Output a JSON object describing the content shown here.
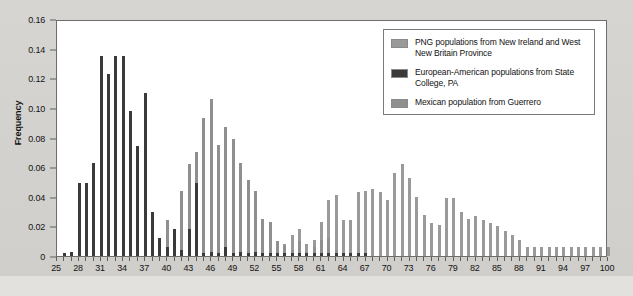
{
  "chart_data": {
    "type": "bar",
    "title": "",
    "xlabel": "",
    "ylabel": "Frequency",
    "xlim": [
      25,
      100
    ],
    "ylim": [
      0,
      0.16
    ],
    "ytick_labels": [
      "0",
      "0.02",
      "0.04",
      "0.06",
      "0.08",
      "0.10",
      "0.12",
      "0.14",
      "0.16"
    ],
    "ytick_values": [
      0,
      0.02,
      0.04,
      0.06,
      0.08,
      0.1,
      0.12,
      0.14,
      0.16
    ],
    "xtick_labels": [
      "25",
      "28",
      "31",
      "34",
      "37",
      "40",
      "43",
      "46",
      "49",
      "52",
      "55",
      "58",
      "61",
      "64",
      "67",
      "70",
      "73",
      "76",
      "79",
      "82",
      "85",
      "88",
      "91",
      "94",
      "97",
      "100"
    ],
    "xtick_values": [
      25,
      28,
      31,
      34,
      37,
      40,
      43,
      46,
      49,
      52,
      55,
      58,
      61,
      64,
      67,
      70,
      73,
      76,
      79,
      82,
      85,
      88,
      91,
      94,
      97,
      100
    ],
    "grid": false,
    "legend_position": "top-right",
    "colors": {
      "png": "#9a9a9a",
      "european_american": "#3a3a3a",
      "mexican": "#8f8f8f"
    },
    "series": [
      {
        "name": "European-American populations from State College, PA",
        "color": "#3a3a3a",
        "x": [
          26,
          27,
          28,
          29,
          30,
          31,
          32,
          33,
          34,
          35,
          36,
          37,
          38,
          39,
          40,
          41,
          42,
          43,
          44,
          45,
          46,
          47,
          48,
          49,
          50,
          51,
          52,
          53,
          54,
          55,
          56,
          57,
          58,
          59,
          60,
          61,
          62,
          63,
          64,
          65,
          66,
          67
        ],
        "values": [
          0.002,
          0.003,
          0.049,
          0.049,
          0.063,
          0.135,
          0.123,
          0.135,
          0.135,
          0.098,
          0.074,
          0.11,
          0.03,
          0.012,
          0.006,
          0.018,
          0.004,
          0.018,
          0.049,
          0.002,
          0.003,
          0.002,
          0.006,
          0.002,
          0.003,
          0.002,
          0.003,
          0.002,
          0.002,
          0.002,
          0.002,
          0.002,
          0.002,
          0.002,
          0.002,
          0.002,
          0.002,
          0.002,
          0.002,
          0.002,
          0.002,
          0.002
        ]
      },
      {
        "name": "Mexican population from Guerrero",
        "color": "#8f8f8f",
        "x": [
          37,
          38,
          39,
          40,
          41,
          42,
          43,
          44,
          45,
          46,
          47,
          48,
          49,
          50,
          51,
          52,
          53,
          54,
          55,
          56,
          57,
          58,
          59,
          60,
          61,
          62,
          63
        ],
        "values": [
          0.018,
          0.021,
          0.012,
          0.024,
          0.018,
          0.044,
          0.062,
          0.07,
          0.093,
          0.106,
          0.075,
          0.087,
          0.079,
          0.063,
          0.051,
          0.044,
          0.025,
          0.023,
          0.01,
          0.007,
          0.004,
          0.01,
          0.003,
          0.006,
          0.011,
          0.012,
          0.004
        ]
      },
      {
        "name": "PNG populations from New Ireland and West New Britain Province",
        "color": "#9a9a9a",
        "x": [
          55,
          56,
          57,
          58,
          59,
          60,
          61,
          62,
          63,
          64,
          65,
          66,
          67,
          68,
          69,
          70,
          71,
          72,
          73,
          74,
          75,
          76,
          77,
          78,
          79,
          80,
          81,
          82,
          83,
          84,
          85,
          86,
          87,
          88,
          89,
          90,
          91,
          92,
          93,
          94,
          95,
          96,
          97,
          98,
          99,
          100
        ],
        "values": [
          0.004,
          0.008,
          0.014,
          0.018,
          0.008,
          0.011,
          0.023,
          0.038,
          0.041,
          0.024,
          0.024,
          0.043,
          0.044,
          0.045,
          0.043,
          0.038,
          0.056,
          0.062,
          0.053,
          0.04,
          0.028,
          0.022,
          0.021,
          0.039,
          0.039,
          0.03,
          0.025,
          0.027,
          0.024,
          0.022,
          0.02,
          0.017,
          0.014,
          0.011,
          0.006,
          0.006,
          0.006,
          0.006,
          0.006,
          0.006,
          0.006,
          0.006,
          0.006,
          0.006,
          0.006,
          0.006
        ]
      }
    ]
  },
  "legend": {
    "items": [
      {
        "label": "PNG populations from New Ireland and West New Britain Province",
        "color": "#9a9a9a",
        "swatch_name": "legend-swatch-png"
      },
      {
        "label": "European-American populations from State College, PA",
        "color": "#3a3a3a",
        "swatch_name": "legend-swatch-european-american"
      },
      {
        "label": "Mexican population from Guerrero",
        "color": "#8f8f8f",
        "swatch_name": "legend-swatch-mexican"
      }
    ]
  }
}
